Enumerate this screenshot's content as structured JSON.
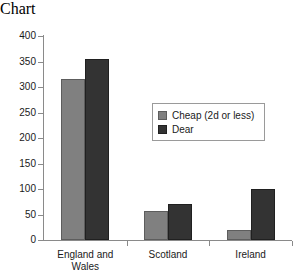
{
  "chart_data": {
    "type": "bar",
    "title": "",
    "subtitle": "",
    "xlabel": "",
    "ylabel": "",
    "categories": [
      "England and Wales",
      "Scotland",
      "Ireland"
    ],
    "category_lines": [
      [
        "England and",
        "Wales"
      ],
      [
        "Scotland"
      ],
      [
        "Ireland"
      ]
    ],
    "series": [
      {
        "name": "Cheap (2d or less)",
        "color": "#808080",
        "values": [
          316,
          57,
          20
        ]
      },
      {
        "name": "Dear",
        "color": "#333333",
        "values": [
          354,
          71,
          100
        ]
      }
    ],
    "ylim": [
      0,
      400
    ],
    "yticks": [
      0,
      50,
      100,
      150,
      200,
      250,
      300,
      350,
      400
    ],
    "ytick_labels": [
      "0",
      "50",
      "100",
      "150",
      "200",
      "250",
      "300",
      "350",
      "400"
    ],
    "grid": false,
    "legend_position": "upper-center-right",
    "axis_color": "#8a8a8a",
    "background": "#ffffff"
  }
}
